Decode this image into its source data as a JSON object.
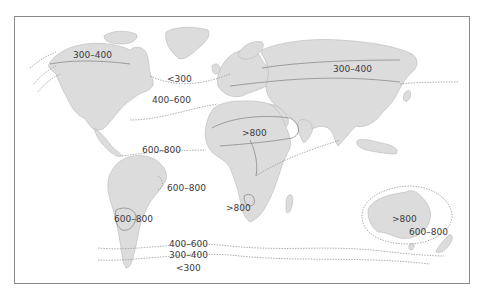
{
  "map": {
    "type": "world-zone-map",
    "colors": {
      "land": "#dcdcdc",
      "ocean": "#ffffff",
      "contour": "#8c8c8c",
      "border": "#8a8a8a",
      "label": "#3a3a3a"
    },
    "labels": [
      {
        "id": "na_north",
        "text": "300–400",
        "x": 73,
        "y": 55
      },
      {
        "id": "atlantic_north",
        "text": "<300",
        "x": 167,
        "y": 74
      },
      {
        "id": "atlantic_mid",
        "text": "400–600",
        "x": 152,
        "y": 95
      },
      {
        "id": "asia_north",
        "text": "300–400",
        "x": 333,
        "y": 62
      },
      {
        "id": "sahara",
        "text": ">800",
        "x": 242,
        "y": 132
      },
      {
        "id": "atlantic_tropic",
        "text": "600–800",
        "x": 142,
        "y": 147
      },
      {
        "id": "brazil_east",
        "text": "600–800",
        "x": 167,
        "y": 183
      },
      {
        "id": "south_africa",
        "text": ">800",
        "x": 226,
        "y": 203
      },
      {
        "id": "andes",
        "text": "600–800",
        "x": 114,
        "y": 214
      },
      {
        "id": "australia_center",
        "text": ">800",
        "x": 392,
        "y": 216
      },
      {
        "id": "australia_south",
        "text": "600–800",
        "x": 409,
        "y": 229
      },
      {
        "id": "southern_1",
        "text": "400–600",
        "x": 169,
        "y": 239
      },
      {
        "id": "southern_2",
        "text": "300–400",
        "x": 169,
        "y": 251
      },
      {
        "id": "southern_3",
        "text": "<300",
        "x": 176,
        "y": 264
      }
    ]
  }
}
